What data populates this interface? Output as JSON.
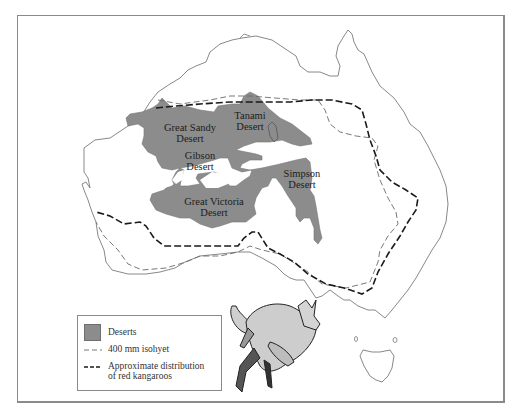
{
  "map": {
    "title": "Deserts, 400 mm isohyet and distribution of red kangaroos in Australia",
    "deserts": [
      {
        "name_line1": "Great Sandy",
        "name_line2": "Desert"
      },
      {
        "name_line1": "Tanami",
        "name_line2": "Desert"
      },
      {
        "name_line1": "Gibson",
        "name_line2": "Desert"
      },
      {
        "name_line1": "Simpson",
        "name_line2": "Desert"
      },
      {
        "name_line1": "Great Victoria",
        "name_line2": "Desert"
      }
    ],
    "colors": {
      "desert_fill": "#8c8c8c",
      "coastline": "#7a7a7a",
      "isohyet": "#6a6a6a",
      "kangaroo_range": "#1a1a1a",
      "frame": "#8a8a8a"
    }
  },
  "legend": {
    "items": [
      {
        "symbol": "gray-fill-swatch",
        "label": "Deserts"
      },
      {
        "symbol": "thin-dashed-line",
        "label": "400 mm isohyet"
      },
      {
        "symbol": "thick-dashed-line",
        "label_line1": "Approximate distribution",
        "label_line2": "of red kangaroos"
      }
    ]
  },
  "illustration": {
    "subject": "red kangaroo with joey in pouch (hopping)"
  }
}
